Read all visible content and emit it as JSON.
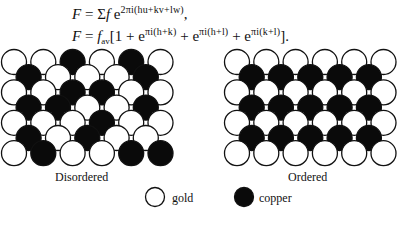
{
  "equations": {
    "eq1": {
      "lhs": "F",
      "eq": " = ",
      "sum": "Σ",
      "f": "f",
      "e": " e",
      "exponent": "2πi(hu+kv+lw)",
      "trail": ","
    },
    "eq2": {
      "lhs": "F",
      "eq": " = ",
      "f": "f",
      "sub": "av",
      "open": "[1 + e",
      "exp1": "πi(h+k)",
      "plus1": " + e",
      "exp2": "πi(h+l)",
      "plus2": " + e",
      "exp3": "πi(k+l)",
      "close": "]."
    }
  },
  "diagrams": {
    "disordered": {
      "label": "Disordered",
      "origin_x": 14,
      "rows": [
        [
          "W",
          "W",
          "B",
          "W",
          "B",
          "W"
        ],
        [
          "B",
          "W",
          "W",
          "W",
          "B"
        ],
        [
          "W",
          "W",
          "B",
          "B",
          "W",
          "W"
        ],
        [
          "B",
          "B",
          "W",
          "W",
          "B"
        ],
        [
          "W",
          "W",
          "W",
          "B",
          "W",
          "W"
        ],
        [
          "B",
          "W",
          "B",
          "W",
          "W"
        ],
        [
          "W",
          "B",
          "W",
          "W",
          "B",
          "B"
        ]
      ]
    },
    "ordered": {
      "label": "Ordered",
      "origin_x": 237,
      "rows": [
        [
          "W",
          "W",
          "W",
          "W",
          "W",
          "W"
        ],
        [
          "B",
          "B",
          "B",
          "B",
          "B"
        ],
        [
          "W",
          "W",
          "W",
          "W",
          "W",
          "W"
        ],
        [
          "B",
          "B",
          "B",
          "B",
          "B"
        ],
        [
          "W",
          "W",
          "W",
          "W",
          "W",
          "W"
        ],
        [
          "B",
          "B",
          "B",
          "B",
          "B"
        ],
        [
          "W",
          "W",
          "W",
          "W",
          "W",
          "W"
        ]
      ]
    },
    "geometry": {
      "top_y": 62,
      "row_dy": 15.2,
      "col_dx": 29.3,
      "radius": 12.5
    }
  },
  "legend": {
    "gold": {
      "label": "gold",
      "symbol": "open-circle",
      "color": "#ffffff"
    },
    "copper": {
      "label": "copper",
      "symbol": "filled-circle",
      "color": "#0a0a0a"
    }
  }
}
